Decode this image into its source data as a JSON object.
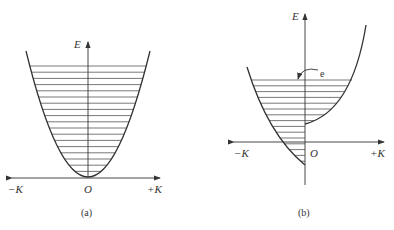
{
  "panels": [
    {
      "id": "a",
      "caption": "(a)",
      "y_axis_label": "E",
      "x_neg_label": "−K",
      "x_pos_label": "+K",
      "origin_label": "O"
    },
    {
      "id": "b",
      "caption": "(b)",
      "y_axis_label": "E",
      "x_neg_label": "−K",
      "x_pos_label": "+K",
      "origin_label": "O",
      "annotation": "e"
    }
  ],
  "colors": {
    "line": "#333333",
    "fill_lines": "#555555"
  }
}
